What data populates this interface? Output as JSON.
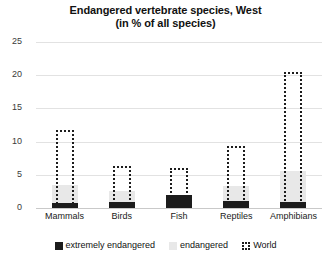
{
  "chart_data": {
    "type": "bar",
    "title": "Endangered vertebrate species, West",
    "subtitle": "(in % of all species)",
    "title_line1": "Endangered vertebrate species, West",
    "title_line2": "(in % of all species)",
    "xlabel": "",
    "ylabel": "",
    "ylim": [
      0,
      25
    ],
    "yticks": [
      0,
      5,
      10,
      15,
      20,
      25
    ],
    "ytick_labels": [
      "0",
      "5",
      "10",
      "15",
      "20",
      "25"
    ],
    "grid": true,
    "grid_axis": "y",
    "legend_position": "bottom",
    "categories": [
      "Mammals",
      "Birds",
      "Fish",
      "Reptiles",
      "Amphibians"
    ],
    "series": [
      {
        "name": "extremely endangered",
        "color": "#1c1c1c",
        "style": "solid-dark",
        "values": [
          0.8,
          0.9,
          2.0,
          1.0,
          0.9
        ]
      },
      {
        "name": "endangered",
        "color": "#e8e8e8",
        "style": "solid-light",
        "values": [
          3.5,
          2.6,
          2.0,
          3.3,
          5.5
        ]
      },
      {
        "name": "World",
        "color": "#1c1c1c",
        "style": "dotted-outline",
        "values": [
          11.8,
          6.3,
          6.0,
          9.4,
          20.5
        ]
      }
    ]
  },
  "legend": {
    "items": [
      {
        "label": "extremely endangered",
        "swatch": "solid-dark-square"
      },
      {
        "label": "endangered",
        "swatch": "solid-light-square"
      },
      {
        "label": "World",
        "swatch": "dotted-outline-square"
      }
    ]
  }
}
